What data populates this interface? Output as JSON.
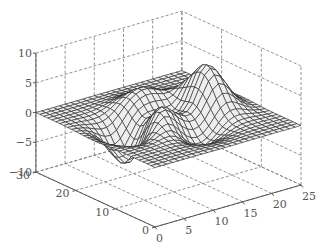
{
  "chart_data": {
    "type": "surface",
    "title": "",
    "function": "peaks",
    "xlabel": "",
    "ylabel": "",
    "zlabel": "",
    "x_range": [
      0,
      25
    ],
    "y_range": [
      0,
      30
    ],
    "z_range": [
      -10,
      10
    ],
    "x_ticks": [
      0,
      5,
      10,
      15,
      20,
      25
    ],
    "y_ticks": [
      0,
      10,
      20,
      30
    ],
    "z_ticks": [
      -10,
      -5,
      0,
      5,
      10
    ],
    "grid": true,
    "grid_style": "dashed",
    "grid_size": [
      25,
      30
    ],
    "z_peak_max": 8.1,
    "z_peak_min": -6.5,
    "surface_color": "#eeeeee",
    "edge_color": "#222222",
    "legend": null
  },
  "labels": {
    "x_ticks": [
      "0",
      "5",
      "10",
      "15",
      "20",
      "25"
    ],
    "y_ticks": [
      "0",
      "10",
      "20",
      "30"
    ],
    "z_ticks": [
      "-10",
      "-5",
      "0",
      "5",
      "10"
    ]
  }
}
